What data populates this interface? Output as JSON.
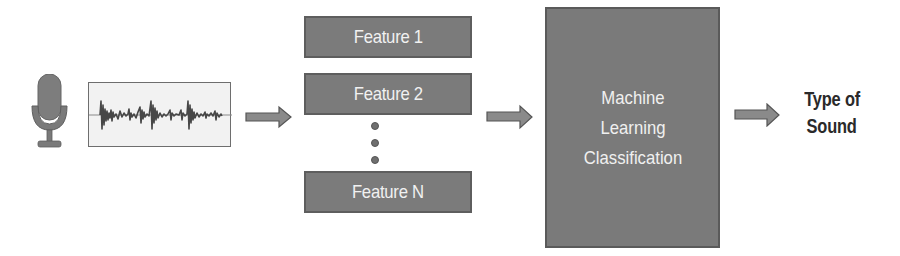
{
  "diagram": {
    "colors": {
      "box_fill": "#7b7b7b",
      "box_border": "#5e5e5e",
      "box_text": "#f1f1f1",
      "arrow_fill": "#8a8a8a",
      "arrow_border": "#555555",
      "output_text": "#2a2a2a",
      "waveform": "#4a4a4a",
      "waveform_bg": "#f2f2f2"
    },
    "input": {
      "microphone_icon": "microphone-icon",
      "waveform_icon": "audio-waveform-icon"
    },
    "features": [
      {
        "label": "Feature 1"
      },
      {
        "label": "Feature 2"
      },
      {
        "label": "Feature N"
      }
    ],
    "ellipsis": "vertical-dots",
    "classifier": {
      "lines": [
        "Machine",
        "Learning",
        "Classification"
      ]
    },
    "output": {
      "lines": [
        "Type of",
        "Sound"
      ]
    },
    "edges": [
      {
        "from": "waveform",
        "to": "features"
      },
      {
        "from": "features",
        "to": "classifier"
      },
      {
        "from": "classifier",
        "to": "output"
      }
    ]
  }
}
